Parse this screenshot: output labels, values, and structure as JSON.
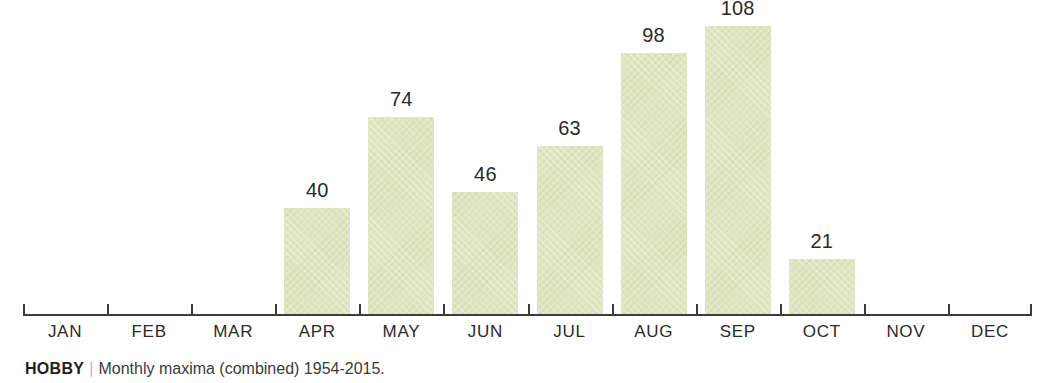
{
  "figure": {
    "title_fragment": "",
    "caption": {
      "source": "HOBBY",
      "separator": "|",
      "description": "Monthly maxima (combined) 1954-2015."
    }
  },
  "chart_data": {
    "type": "bar",
    "title": "",
    "subtitle": "",
    "xlabel": "",
    "ylabel": "",
    "categories": [
      "JAN",
      "FEB",
      "MAR",
      "APR",
      "MAY",
      "JUN",
      "JUL",
      "AUG",
      "SEP",
      "OCT",
      "NOV",
      "DEC"
    ],
    "values": [
      0,
      0,
      0,
      40,
      74,
      46,
      63,
      98,
      108,
      21,
      0,
      0
    ],
    "value_labels": [
      "",
      "",
      "",
      "40",
      "74",
      "46",
      "63",
      "98",
      "108",
      "21",
      "",
      ""
    ],
    "ylim": [
      0,
      115
    ],
    "grid": false,
    "legend": null,
    "bar_color": "#dee5c0",
    "axis_color": "#3c3c3c",
    "label_color": "#2a2a2a",
    "annotations": []
  }
}
